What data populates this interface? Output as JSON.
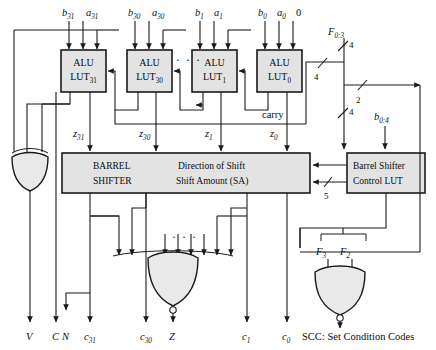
{
  "figure": {
    "type": "logic-block-diagram"
  },
  "inputs": {
    "operands": [
      {
        "b": "b",
        "b_sub": "31",
        "a": "a",
        "a_sub": "31"
      },
      {
        "b": "b",
        "b_sub": "30",
        "a": "a",
        "a_sub": "30"
      },
      {
        "b": "b",
        "b_sub": "1",
        "a": "a",
        "a_sub": "1"
      },
      {
        "b": "b",
        "b_sub": "0",
        "a": "a",
        "a_sub": "0"
      }
    ],
    "carry_in_const": "0",
    "carry_label": "carry",
    "f_bus_label": "F",
    "f_bus_sub": "0:3",
    "b04_label": "b",
    "b04_sub": "0:4"
  },
  "alus": [
    {
      "line1": "ALU",
      "line2": "LUT",
      "sub": "31"
    },
    {
      "line1": "ALU",
      "line2": "LUT",
      "sub": "30"
    },
    {
      "line1": "ALU",
      "line2": "LUT",
      "sub": "1"
    },
    {
      "line1": "ALU",
      "line2": "LUT",
      "sub": "0"
    }
  ],
  "ellipsis": "· · ·",
  "z_signals": [
    {
      "name": "z",
      "sub": "31"
    },
    {
      "name": "z",
      "sub": "30"
    },
    {
      "name": "z",
      "sub": "1"
    },
    {
      "name": "z",
      "sub": "0"
    }
  ],
  "barrel_shifter": {
    "line1": "BARREL",
    "line2": "SHIFTER",
    "control_line1": "Direction of Shift",
    "control_line2": "Shift Amount (SA)"
  },
  "control_lut": {
    "line1": "Barrel Shifter",
    "line2": "Control LUT"
  },
  "bus_widths": {
    "f_top": "4",
    "f_left": "4",
    "two": "2",
    "f_lower": "4",
    "sa": "5"
  },
  "scc_inputs": [
    {
      "name": "F",
      "sub": "3"
    },
    {
      "name": "F",
      "sub": "2"
    }
  ],
  "outputs": [
    {
      "name": "V",
      "sub": ""
    },
    {
      "name": "C",
      "sub": ""
    },
    {
      "name": "N",
      "sub": ""
    },
    {
      "name": "c",
      "sub": "31"
    },
    {
      "name": "c",
      "sub": "30"
    },
    {
      "name": "Z",
      "sub": ""
    },
    {
      "name": "c",
      "sub": "1"
    },
    {
      "name": "c",
      "sub": "0"
    }
  ],
  "legend": {
    "scc_note": "SCC: Set Condition Codes"
  }
}
